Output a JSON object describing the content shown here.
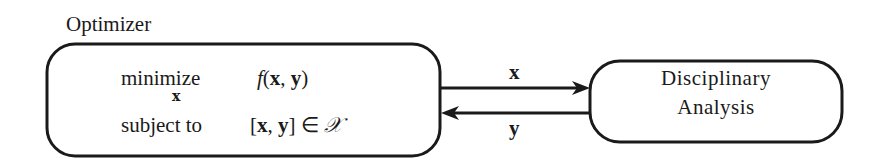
{
  "optimizer": {
    "title": "Optimizer",
    "objective_keyword": "minimize",
    "objective_subscript": "x",
    "objective_fn": "f",
    "objective_args_open": "(",
    "objective_arg1": "x",
    "objective_comma": ", ",
    "objective_arg2": "y",
    "objective_args_close": ")",
    "constraint_keyword": "subject to",
    "constraint_open": "[",
    "constraint_arg1": "x",
    "constraint_comma": ", ",
    "constraint_arg2": "y",
    "constraint_close": "]",
    "constraint_in": " ∈ ",
    "constraint_set": "𝒳"
  },
  "arrows": {
    "forward_label": "x",
    "backward_label": "y"
  },
  "analysis": {
    "line1": "Disciplinary",
    "line2": "Analysis"
  },
  "colors": {
    "stroke": "#1a1a1a",
    "background": "#ffffff"
  }
}
